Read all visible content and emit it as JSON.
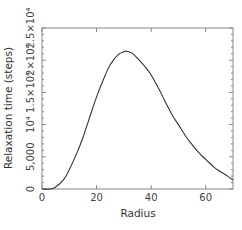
{
  "chart_data": {
    "type": "line",
    "title": "",
    "xlabel": "Radius",
    "ylabel": "Relaxation time (steps)",
    "xlim": [
      0,
      70
    ],
    "ylim": [
      0,
      25000
    ],
    "grid": false,
    "legend": null,
    "x_ticks": [
      0,
      20,
      40,
      60
    ],
    "x_tick_labels": [
      "0",
      "20",
      "40",
      "60"
    ],
    "y_ticks": [
      0,
      5000,
      10000,
      15000,
      20000,
      25000
    ],
    "y_tick_labels": [
      "0",
      "5,000",
      "10⁴",
      "1.5×10⁴",
      "2×10⁴",
      "2.5×10⁴"
    ],
    "series": [
      {
        "name": "relaxation time",
        "color": "#333333",
        "x": [
          0,
          3,
          5,
          8,
          10,
          13,
          15,
          18,
          20,
          23,
          25,
          28,
          30,
          31,
          33,
          35,
          38,
          40,
          43,
          45,
          48,
          50,
          53,
          55,
          58,
          60,
          63,
          65,
          68,
          70
        ],
        "y": [
          0,
          0,
          300,
          1500,
          3000,
          5800,
          8000,
          11800,
          14300,
          17500,
          19300,
          20900,
          21300,
          21400,
          21100,
          20300,
          18900,
          17700,
          15400,
          13700,
          11300,
          10000,
          8000,
          6900,
          5400,
          4600,
          3400,
          2800,
          2000,
          1400
        ]
      }
    ]
  },
  "plot": {
    "x_label": "Radius",
    "y_label": "Relaxation time (steps)"
  }
}
